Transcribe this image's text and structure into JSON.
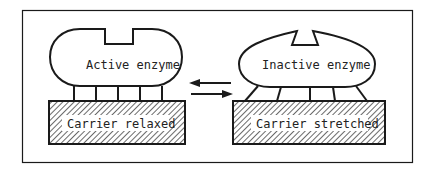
{
  "diagram": {
    "left": {
      "enzyme_label": "Active enzyme",
      "carrier_label": "Carrier relaxed"
    },
    "right": {
      "enzyme_label": "Inactive enzyme",
      "carrier_label": "Carrier stretched"
    },
    "arrows": {
      "top_direction": "left",
      "bottom_direction": "right"
    },
    "colors": {
      "stroke": "#1a1a1a",
      "background": "#ffffff"
    }
  }
}
